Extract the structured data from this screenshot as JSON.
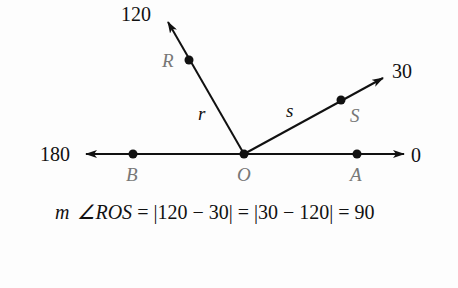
{
  "diagram": {
    "type": "protractor-postulate-angle",
    "vertex": {
      "label": "O",
      "x": 244,
      "y": 154
    },
    "points": [
      {
        "label": "B",
        "x": 133,
        "y": 154
      },
      {
        "label": "A",
        "x": 357,
        "y": 154
      },
      {
        "label": "R",
        "x": 189,
        "y": 60
      },
      {
        "label": "S",
        "x": 341,
        "y": 100
      }
    ],
    "rays": [
      {
        "name": "r",
        "through": "R",
        "measure": "120"
      },
      {
        "name": "s",
        "through": "S",
        "measure": "30"
      }
    ],
    "line_measures": {
      "left": "180",
      "right": "0"
    },
    "labels": {
      "m120": "120",
      "m30": "30",
      "m180": "180",
      "m0": "0",
      "R": "R",
      "S": "S",
      "B": "B",
      "O": "O",
      "A": "A",
      "r": "r",
      "s": "s"
    },
    "equation": {
      "m": "m",
      "angle": "∠ROS",
      "rest": " = |120 − 30| = |30 − 120| = 90"
    },
    "colors": {
      "line": "#111111",
      "point_label": "#777777"
    }
  }
}
